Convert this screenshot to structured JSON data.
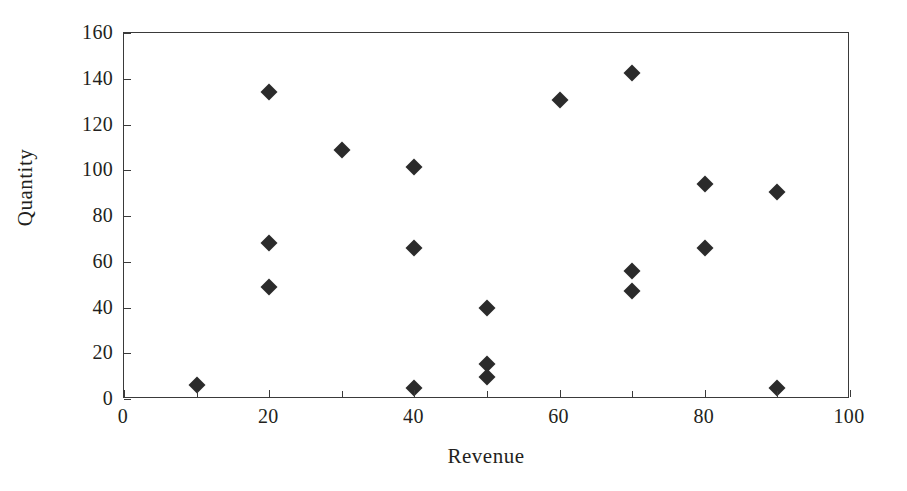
{
  "chart_data": {
    "type": "scatter",
    "title": "",
    "xlabel": "Revenue",
    "ylabel": "Quantity",
    "xlim": [
      0,
      100
    ],
    "ylim": [
      0,
      160
    ],
    "grid": false,
    "legend": null,
    "marker": "diamond",
    "marker_color": "#2b2b2b",
    "axis_color": "#3a3a3a",
    "background_color": "#ffffff",
    "x_ticks": [
      0,
      20,
      40,
      60,
      80,
      100
    ],
    "x_tick_labels": [
      "0",
      "20",
      "40",
      "60",
      "80",
      "100"
    ],
    "x_minor_ticks": [
      10,
      30,
      50,
      70,
      90
    ],
    "y_ticks": [
      0,
      20,
      40,
      60,
      80,
      100,
      120,
      140,
      160
    ],
    "y_tick_labels": [
      "0",
      "20",
      "40",
      "60",
      "80",
      "100",
      "120",
      "140",
      "160"
    ],
    "points": [
      {
        "x": 10,
        "y": 6
      },
      {
        "x": 20,
        "y": 134
      },
      {
        "x": 20,
        "y": 68
      },
      {
        "x": 20,
        "y": 49
      },
      {
        "x": 30,
        "y": 109
      },
      {
        "x": 40,
        "y": 101.5
      },
      {
        "x": 40,
        "y": 66
      },
      {
        "x": 40,
        "y": 5
      },
      {
        "x": 50,
        "y": 40
      },
      {
        "x": 50,
        "y": 15.5
      },
      {
        "x": 50,
        "y": 9.5
      },
      {
        "x": 60,
        "y": 130.5
      },
      {
        "x": 70,
        "y": 142.5
      },
      {
        "x": 70,
        "y": 56
      },
      {
        "x": 70,
        "y": 47
      },
      {
        "x": 80,
        "y": 94
      },
      {
        "x": 80,
        "y": 66
      },
      {
        "x": 90,
        "y": 90.5
      },
      {
        "x": 90,
        "y": 5
      }
    ]
  }
}
